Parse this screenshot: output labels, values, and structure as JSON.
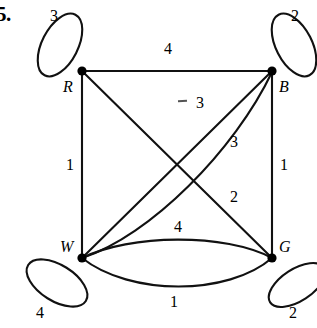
{
  "figure": {
    "problem_number": "5.",
    "caption": "Weighted multigraph on four vertices R, B, W, G with self-loops"
  },
  "vertices": [
    {
      "id": "R",
      "label": "R",
      "x": 82,
      "y": 71
    },
    {
      "id": "B",
      "label": "B",
      "x": 272,
      "y": 71
    },
    {
      "id": "W",
      "label": "W",
      "x": 82,
      "y": 258
    },
    {
      "id": "G",
      "label": "G",
      "x": 272,
      "y": 258
    }
  ],
  "vertex_label_positions": [
    {
      "id": "R",
      "x": 63,
      "y": 79
    },
    {
      "id": "B",
      "x": 279,
      "y": 79
    },
    {
      "id": "W",
      "x": 60,
      "y": 239
    },
    {
      "id": "G",
      "x": 279,
      "y": 239
    }
  ],
  "loops": [
    {
      "at": "R",
      "weight": "3",
      "label_x": 50,
      "label_y": 8
    },
    {
      "at": "B",
      "weight": "2",
      "label_x": 291,
      "label_y": 8
    },
    {
      "at": "W",
      "weight": "4",
      "label_x": 36,
      "label_y": 305
    },
    {
      "at": "G",
      "weight": "2",
      "label_x": 289,
      "label_y": 305
    }
  ],
  "edges": [
    {
      "from": "R",
      "to": "B",
      "kind": "straight",
      "weight": "4",
      "label_x": 164,
      "label_y": 41
    },
    {
      "from": "R",
      "to": "W",
      "kind": "straight",
      "weight": "1",
      "label_x": 66,
      "label_y": 157
    },
    {
      "from": "B",
      "to": "G",
      "kind": "straight",
      "weight": "1",
      "label_x": 280,
      "label_y": 157
    },
    {
      "from": "R",
      "to": "G",
      "kind": "diagonal",
      "weight": "2",
      "label_x": 230,
      "label_y": 189
    },
    {
      "from": "W",
      "to": "B",
      "kind": "diagonal",
      "weight": "3",
      "label_x": 196,
      "label_y": 95
    },
    {
      "from": "W",
      "to": "B",
      "kind": "diagonal-2",
      "weight": "3",
      "label_x": 230,
      "label_y": 134
    },
    {
      "from": "W",
      "to": "G",
      "kind": "curve-up",
      "weight": "4",
      "label_x": 174,
      "label_y": 219
    },
    {
      "from": "W",
      "to": "G",
      "kind": "curve-down",
      "weight": "1",
      "label_x": 170,
      "label_y": 294
    }
  ],
  "style": {
    "stroke_color": "#111111",
    "node_color": "#000000",
    "background": "#ffffff"
  }
}
